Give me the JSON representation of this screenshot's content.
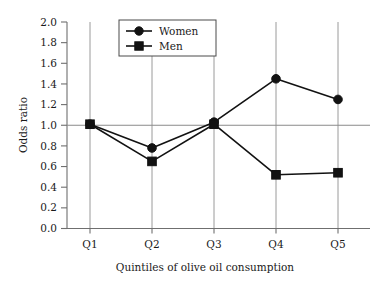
{
  "chart_data": {
    "type": "line",
    "title": "",
    "xlabel": "Quintiles of olive oil consumption",
    "ylabel": "Odds ratio",
    "categories": [
      "Q1",
      "Q2",
      "Q3",
      "Q4",
      "Q5"
    ],
    "series": [
      {
        "name": "Women",
        "marker": "circle",
        "values": [
          1.01,
          0.78,
          1.03,
          1.45,
          1.25
        ]
      },
      {
        "name": "Men",
        "marker": "square",
        "values": [
          1.01,
          0.65,
          1.01,
          0.52,
          0.54
        ]
      }
    ],
    "ylim": [
      0.0,
      2.0
    ],
    "ytick_labels": [
      "0.0",
      "0.2",
      "0.4",
      "0.6",
      "0.8",
      "1.0",
      "1.2",
      "1.4",
      "1.6",
      "1.8",
      "2.0"
    ],
    "ytick_values": [
      0.0,
      0.2,
      0.4,
      0.6,
      0.8,
      1.0,
      1.2,
      1.4,
      1.6,
      1.8,
      2.0
    ],
    "grid": "vertical-at-categories",
    "reference_line": 1.0,
    "legend_position": "top-center",
    "legend_entries": [
      "Women",
      "Men"
    ],
    "colors": {
      "line": "#121212",
      "marker": "#121212",
      "axis": "#6f6f6f",
      "grid": "#9a9a9a",
      "background": "#ffffff"
    }
  }
}
